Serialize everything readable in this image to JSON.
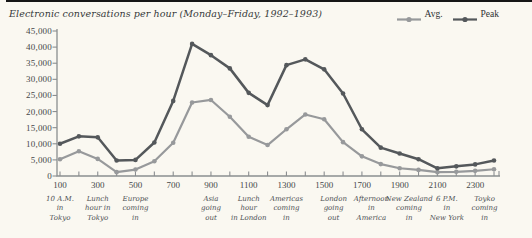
{
  "page": {
    "background": "#faf8f1",
    "top_rule_color": "#161616"
  },
  "chart_data": {
    "type": "line",
    "title": "Electronic conversations per hour (Monday–Friday, 1992–1993)",
    "x": [
      100,
      200,
      300,
      400,
      500,
      600,
      700,
      800,
      900,
      1000,
      1100,
      1200,
      1300,
      1400,
      1500,
      1600,
      1700,
      1800,
      1900,
      2000,
      2100,
      2200,
      2300,
      2400
    ],
    "series": [
      {
        "name": "Avg.",
        "color": "#97999b",
        "values": [
          5200,
          7700,
          5300,
          1200,
          2000,
          4600,
          10300,
          22800,
          23600,
          18400,
          12200,
          9600,
          14500,
          19100,
          17600,
          10500,
          6100,
          3700,
          2400,
          1900,
          1200,
          1300,
          1600,
          2100
        ]
      },
      {
        "name": "Peak",
        "color": "#54585b",
        "values": [
          10000,
          12300,
          12000,
          4800,
          5000,
          10400,
          23300,
          41000,
          37500,
          33400,
          25800,
          22000,
          34400,
          36200,
          33100,
          25600,
          14500,
          8800,
          7000,
          5200,
          2400,
          3000,
          3600,
          4800
        ]
      }
    ],
    "ylim": [
      0,
      45000
    ],
    "y_tick_values": [
      0,
      5000,
      10000,
      15000,
      20000,
      25000,
      30000,
      35000,
      40000,
      45000
    ],
    "y_tick_labels": [
      "0",
      "5,000",
      "10,000",
      "15,000",
      "20,000",
      "25,000",
      "30,000",
      "35,000",
      "40,000",
      "45,000"
    ],
    "x_labels": [
      {
        "hour": 100,
        "label": "100"
      },
      {
        "hour": 300,
        "label": "300"
      },
      {
        "hour": 500,
        "label": "500"
      },
      {
        "hour": 700,
        "label": "700"
      },
      {
        "hour": 900,
        "label": "900"
      },
      {
        "hour": 1100,
        "label": "1100"
      },
      {
        "hour": 1300,
        "label": "1300"
      },
      {
        "hour": 1500,
        "label": "1500"
      },
      {
        "hour": 1700,
        "label": "1700"
      },
      {
        "hour": 1900,
        "label": "1900"
      },
      {
        "hour": 2100,
        "label": "2100"
      },
      {
        "hour": 2300,
        "label": "2300"
      }
    ],
    "annotations": [
      {
        "hour": 100,
        "text": "10 A.M.\nin\nTokyo"
      },
      {
        "hour": 300,
        "text": "Lunch\nhour in\nTokyo"
      },
      {
        "hour": 500,
        "text": "Europe\ncoming\nin"
      },
      {
        "hour": 900,
        "text": "Asia\ngoing\nout"
      },
      {
        "hour": 1100,
        "text": "Lunch\nhour\nin London"
      },
      {
        "hour": 1300,
        "text": "Americas\ncoming\nin"
      },
      {
        "hour": 1550,
        "text": "London\ngoing\nout"
      },
      {
        "hour": 1750,
        "text": "Afternoon\nin\nAmerica"
      },
      {
        "hour": 1950,
        "text": "New Zealand\ncoming\nin"
      },
      {
        "hour": 2150,
        "text": "6 P.M.\nin\nNew York"
      },
      {
        "hour": 2350,
        "text": "Toyko\ncoming\nin"
      }
    ],
    "legend_position": "top-right",
    "grid": false,
    "axis_color": "#8b8e90"
  }
}
